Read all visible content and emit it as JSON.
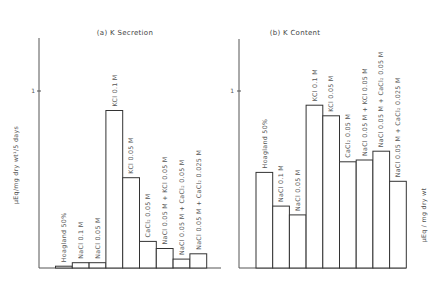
{
  "chart_data": [
    {
      "type": "bar",
      "title": "(a) K Secretion",
      "ylabel": "μEq/mg dry wt/5 days",
      "xlabel": "",
      "yticks": [
        "1"
      ],
      "ylim": [
        0,
        1.3
      ],
      "grid": false,
      "categories": [
        "Hoagland 50%",
        "NaCl 0.1 M",
        "NaCl 0.05 M",
        "KCl 0.1 M",
        "KCl 0.05 M",
        "CaCl2 0.05 M",
        "NaCl 0.05 M + KCl 0.05 M",
        "NaCl 0.05 M + CaCl2 0.05 M",
        "NaCl 0.05 M + CaCl2 0.025 M"
      ],
      "values": [
        0.01,
        0.03,
        0.03,
        0.89,
        0.51,
        0.15,
        0.11,
        0.05,
        0.08
      ]
    },
    {
      "type": "bar",
      "title": "(b) K Content",
      "ylabel": "μEq/mg dry wt",
      "xlabel": "",
      "yticks": [
        "1"
      ],
      "ylim": [
        0,
        1.3
      ],
      "grid": false,
      "categories": [
        "Hoagland 50%",
        "NaCl 0.1 M",
        "NaCl 0.05 M",
        "KCl 0.1 M",
        "KCl 0.05 M",
        "CaCl2 0.05 M",
        "NaCl 0.05 M + KCl 0.05 M",
        "NaCl 0.05 M + CaCl2 0.05 M",
        "NaCl 0.05 M + CaCl2 0.025 M"
      ],
      "values": [
        0.54,
        0.35,
        0.3,
        0.92,
        0.86,
        0.6,
        0.61,
        0.66,
        0.49
      ]
    }
  ],
  "panels": {
    "a": {
      "title": "(a) K Secretion",
      "ylabel": "μEq/mg dry wt¹/5 days",
      "tick": "1",
      "labels": [
        "Hoagland 50%",
        "NaCl 0.1 M",
        "NaCl 0.05 M",
        "KCl 0.1 M",
        "KCl 0.05 M",
        "CaCl₂ 0.05 M",
        "NaCl 0.05 M + KCl 0.05 M",
        "NaCl 0.05 M + CaCl₂ 0.05 M",
        "NaCl 0.05 M + CaCl₂ 0.025 M"
      ]
    },
    "b": {
      "title": "(b) K Content",
      "ylabel": "μEq / mg dry wt",
      "tick": "1",
      "labels": [
        "Hoagland 50%",
        "NaCl 0.1 M",
        "NaCl 0.05 M",
        "KCl 0.1 M",
        "KCl 0.05 M",
        "CaCl₂ 0.05 M",
        "NaCl 0.05 M + KCl 0.05 M",
        "NaCl 0.05 M + CaCl₂ 0.05 M",
        "NaCl 0.05 M + CaCl₂ 0.025 M"
      ]
    }
  }
}
